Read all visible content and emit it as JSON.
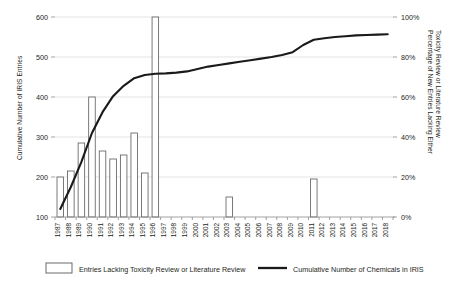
{
  "chart_data": {
    "type": "bar",
    "title": "",
    "subtitle": "",
    "xlabel": "",
    "ylabel": "Cumulative Number of IRIS Entries",
    "y2label": "Percentage of New Entries Lacking Either Toxicity Review or Literature Review",
    "ylim": [
      100,
      600
    ],
    "y2lim": [
      0,
      100
    ],
    "grid": true,
    "legend_position": "bottom",
    "categories": [
      "1987",
      "1988",
      "1989",
      "1990",
      "1991",
      "1992",
      "1993",
      "1994",
      "1995",
      "1996",
      "1997",
      "1998",
      "1999",
      "2000",
      "2001",
      "2002",
      "2003",
      "2004",
      "2005",
      "2006",
      "2007",
      "2008",
      "2009",
      "2010",
      "2011",
      "2012",
      "2013",
      "2014",
      "2015",
      "2016",
      "2017",
      "2018"
    ],
    "yticks": [
      100,
      200,
      300,
      400,
      500,
      600
    ],
    "ytick_labels": [
      "100",
      "200",
      "300",
      "400",
      "500",
      "600"
    ],
    "y2ticks": [
      0,
      20,
      40,
      60,
      80,
      100
    ],
    "y2tick_labels": [
      "0%",
      "20%",
      "40%",
      "60%",
      "80%",
      "100%"
    ],
    "series": [
      {
        "name": "Entries Lacking Toxicity Review or Literature Review",
        "type": "bar",
        "axis": "right",
        "unit": "%",
        "values": [
          20,
          23,
          37,
          60,
          33,
          29,
          31,
          42,
          22,
          100,
          0,
          0,
          0,
          0,
          0,
          0,
          10,
          0,
          0,
          0,
          0,
          0,
          0,
          0,
          19,
          0,
          0,
          0,
          0,
          0,
          0,
          0
        ]
      },
      {
        "name": "Cumulative Number of Chemicals in IRIS",
        "type": "line",
        "axis": "left",
        "unit": "entries",
        "values": [
          120,
          175,
          238,
          310,
          362,
          402,
          428,
          447,
          455,
          458,
          459,
          461,
          464,
          470,
          476,
          480,
          484,
          488,
          492,
          496,
          500,
          505,
          512,
          530,
          543,
          547,
          550,
          552,
          554,
          555,
          556,
          557
        ]
      }
    ]
  },
  "legend": {
    "items": [
      {
        "label": "Entries Lacking Toxicity Review or Literature Review",
        "marker": "bar-swatch"
      },
      {
        "label": "Cumulative Number of Chemicals in IRIS",
        "marker": "line-swatch"
      }
    ]
  },
  "colors": {
    "bar_fill": "#ffffff",
    "bar_stroke": "#58595b",
    "line": "#1a1a1a",
    "grid": "#d9d9d9",
    "axis": "#8c8c8c",
    "text": "#231f20",
    "background": "#ffffff"
  }
}
